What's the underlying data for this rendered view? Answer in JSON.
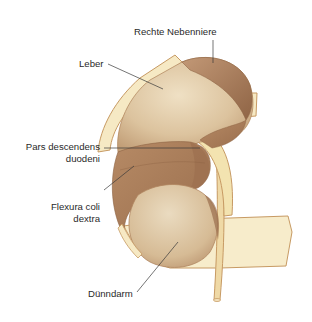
{
  "figure": {
    "type": "anatomical-illustration",
    "colors": {
      "background": "#ffffff",
      "peritoneum_light": "#f6e9c4",
      "peritoneum_edge": "#c79a63",
      "organ_light": "#e6d2b0",
      "organ_mid": "#cfb08a",
      "organ_dark": "#a97d5a",
      "adrenal": "#a87a58",
      "leader_line": "#3a3a3a",
      "label_text": "#2a2a2a"
    }
  },
  "labels": [
    {
      "id": "rechte-nebenniere",
      "text": "Rechte Nebenniere",
      "lines": [
        "Rechte Nebenniere"
      ]
    },
    {
      "id": "leber",
      "text": "Leber",
      "lines": [
        "Leber"
      ]
    },
    {
      "id": "pars-descendens-duodeni",
      "text": "Pars descendens duodeni",
      "lines": [
        "Pars descendens",
        "duodeni"
      ]
    },
    {
      "id": "flexura-coli-dextra",
      "text": "Flexura coli dextra",
      "lines": [
        "Flexura coli",
        "dextra"
      ]
    },
    {
      "id": "duenndarm",
      "text": "Dünndarm",
      "lines": [
        "Dünndarm"
      ]
    }
  ]
}
